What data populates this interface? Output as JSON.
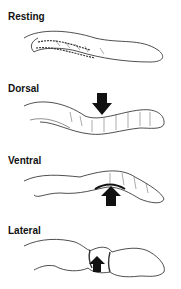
{
  "panels": [
    {
      "label": "Resting",
      "arrow": "none"
    },
    {
      "label": "Dorsal",
      "arrow": "down"
    },
    {
      "label": "Ventral",
      "arrow": "up"
    },
    {
      "label": "Lateral",
      "arrow": "up"
    }
  ],
  "colors": {
    "ink": "#111111",
    "background": "#ffffff"
  }
}
